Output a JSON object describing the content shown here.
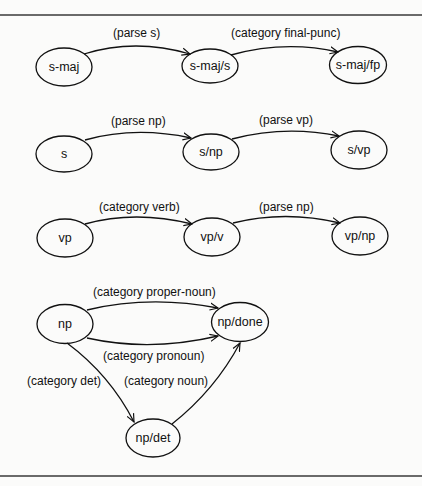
{
  "diagram": {
    "type": "transition-network",
    "colors": {
      "ink": "#111111",
      "background": "#fbfbfa",
      "rule": "#3a3a3a"
    },
    "networks": [
      {
        "name": "s-maj",
        "nodes": [
          {
            "id": "s-maj",
            "label": "s-maj"
          },
          {
            "id": "s-maj/s",
            "label": "s-maj/s"
          },
          {
            "id": "s-maj/fp",
            "label": "s-maj/fp"
          }
        ],
        "edges": [
          {
            "from": "s-maj",
            "to": "s-maj/s",
            "label": "(parse s)"
          },
          {
            "from": "s-maj/s",
            "to": "s-maj/fp",
            "label": "(category final-punc)"
          }
        ]
      },
      {
        "name": "s",
        "nodes": [
          {
            "id": "s",
            "label": "s"
          },
          {
            "id": "s/np",
            "label": "s/np"
          },
          {
            "id": "s/vp",
            "label": "s/vp"
          }
        ],
        "edges": [
          {
            "from": "s",
            "to": "s/np",
            "label": "(parse np)"
          },
          {
            "from": "s/np",
            "to": "s/vp",
            "label": "(parse vp)"
          }
        ]
      },
      {
        "name": "vp",
        "nodes": [
          {
            "id": "vp",
            "label": "vp"
          },
          {
            "id": "vp/v",
            "label": "vp/v"
          },
          {
            "id": "vp/np",
            "label": "vp/np"
          }
        ],
        "edges": [
          {
            "from": "vp",
            "to": "vp/v",
            "label": "(category verb)"
          },
          {
            "from": "vp/v",
            "to": "vp/np",
            "label": "(parse np)"
          }
        ]
      },
      {
        "name": "np",
        "nodes": [
          {
            "id": "np",
            "label": "np"
          },
          {
            "id": "np/done",
            "label": "np/done"
          },
          {
            "id": "np/det",
            "label": "np/det"
          }
        ],
        "edges": [
          {
            "from": "np",
            "to": "np/done",
            "label": "(category proper-noun)"
          },
          {
            "from": "np",
            "to": "np/done",
            "label": "(category pronoun)"
          },
          {
            "from": "np",
            "to": "np/det",
            "label": "(category det)"
          },
          {
            "from": "np/det",
            "to": "np/done",
            "label": "(category noun)"
          }
        ]
      }
    ]
  }
}
